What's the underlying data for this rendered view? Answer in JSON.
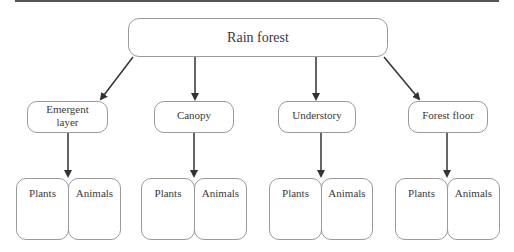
{
  "diagram": {
    "root": {
      "label": "Rain forest"
    },
    "layers": [
      {
        "label": "Emergent layer",
        "line1": "Emergent",
        "line2": "layer",
        "children": [
          {
            "label": "Plants"
          },
          {
            "label": "Animals"
          }
        ]
      },
      {
        "label": "Canopy",
        "children": [
          {
            "label": "Plants"
          },
          {
            "label": "Animals"
          }
        ]
      },
      {
        "label": "Understory",
        "children": [
          {
            "label": "Plants"
          },
          {
            "label": "Animals"
          }
        ]
      },
      {
        "label": "Forest floor",
        "children": [
          {
            "label": "Plants"
          },
          {
            "label": "Animals"
          }
        ]
      }
    ],
    "colors": {
      "line": "#333333",
      "box_border": "#9a9a9a",
      "text": "#3a3a3a"
    }
  }
}
